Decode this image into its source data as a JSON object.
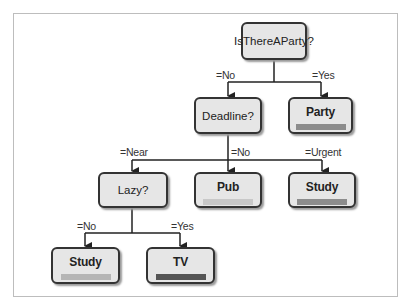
{
  "diagram": {
    "type": "decision-tree",
    "nodes": {
      "root": {
        "label": "IsThereAParty?",
        "kind": "question"
      },
      "deadline": {
        "label": "Deadline?",
        "kind": "question"
      },
      "party": {
        "label": "Party",
        "kind": "leaf",
        "bar_color": "#8c8c8c"
      },
      "lazy": {
        "label": "Lazy?",
        "kind": "question"
      },
      "pub": {
        "label": "Pub",
        "kind": "leaf",
        "bar_color": "#c8c8c8"
      },
      "study_urgent": {
        "label": "Study",
        "kind": "leaf",
        "bar_color": "#8c8c8c"
      },
      "study_lazy_no": {
        "label": "Study",
        "kind": "leaf",
        "bar_color": "#b5b5b5"
      },
      "tv": {
        "label": "TV",
        "kind": "leaf",
        "bar_color": "#555555"
      }
    },
    "edges": {
      "root_no": {
        "label": "=No",
        "from": "root",
        "to": "deadline"
      },
      "root_yes": {
        "label": "=Yes",
        "from": "root",
        "to": "party"
      },
      "deadline_near": {
        "label": "=Near",
        "from": "deadline",
        "to": "lazy"
      },
      "deadline_no": {
        "label": "=No",
        "from": "deadline",
        "to": "pub"
      },
      "deadline_urgent": {
        "label": "=Urgent",
        "from": "deadline",
        "to": "study_urgent"
      },
      "lazy_no": {
        "label": "=No",
        "from": "lazy",
        "to": "study_lazy_no"
      },
      "lazy_yes": {
        "label": "=Yes",
        "from": "lazy",
        "to": "tv"
      }
    }
  }
}
